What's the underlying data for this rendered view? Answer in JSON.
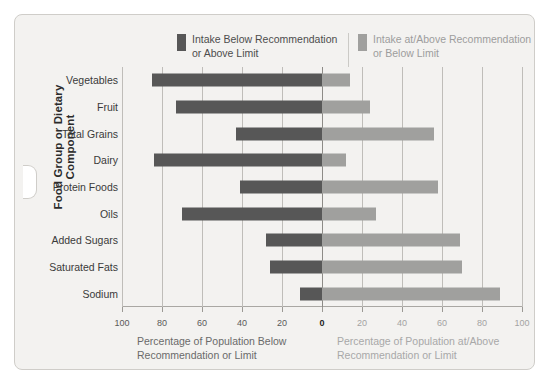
{
  "legend": {
    "left": {
      "label": "Intake Below Recommendation\nor Above Limit",
      "color": "#575757"
    },
    "right": {
      "label": "Intake at/Above Recommendation\nor Below Limit",
      "color": "#a0a09e"
    }
  },
  "axis": {
    "y_title": "Food Group or Dietary Component",
    "caption_left": "Percentage of Population Below\nRecommendation or Limit",
    "caption_right": "Percentage of Population at/Above\nRecommendation or Limit"
  },
  "chart_data": {
    "type": "bar",
    "orientation": "horizontal-diverging",
    "title": "",
    "xlabel": "Percentage of Population",
    "ylabel": "Food Group or Dietary Component",
    "xlim": [
      -100,
      100
    ],
    "xticks": [
      -100,
      -80,
      -60,
      -40,
      -20,
      0,
      20,
      40,
      60,
      80,
      100
    ],
    "xticklabels": [
      "100",
      "80",
      "60",
      "40",
      "20",
      "0",
      "20",
      "40",
      "60",
      "80",
      "100"
    ],
    "grid": true,
    "legend_position": "top",
    "categories": [
      "Vegetables",
      "Fruit",
      "Total Grains",
      "Dairy",
      "Protein Foods",
      "Oils",
      "Added Sugars",
      "Saturated Fats",
      "Sodium"
    ],
    "series": [
      {
        "name": "Intake Below Recommendation or Above Limit",
        "color": "#575757",
        "side": "left",
        "values": [
          85,
          73,
          43,
          84,
          41,
          70,
          28,
          26,
          11
        ]
      },
      {
        "name": "Intake at/Above Recommendation or Below Limit",
        "color": "#a0a09e",
        "side": "right",
        "values": [
          14,
          24,
          56,
          12,
          58,
          27,
          69,
          70,
          89
        ]
      }
    ]
  }
}
